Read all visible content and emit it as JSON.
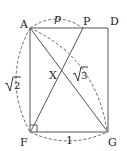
{
  "diagram": {
    "type": "geometry",
    "points": {
      "A": "A",
      "P": "P",
      "D": "D",
      "X": "X",
      "F": "F",
      "G": "G"
    },
    "measures": {
      "AP": "p",
      "AF": "√2",
      "AG": "√3",
      "FG": "1"
    },
    "sqrt2_radicand": "2",
    "sqrt3_radicand": "3",
    "stroke_color": "#555555"
  }
}
